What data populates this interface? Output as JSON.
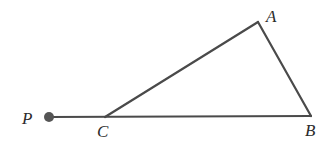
{
  "diagram": {
    "stroke_color": "#4a4a4a",
    "points": {
      "P": {
        "label": "P",
        "x": 49,
        "y": 117,
        "label_x": 22,
        "label_y": 124
      },
      "C": {
        "label": "C",
        "x": 105,
        "y": 117,
        "label_x": 97,
        "label_y": 137
      },
      "B": {
        "label": "B",
        "x": 311,
        "y": 116,
        "label_x": 305,
        "label_y": 136
      },
      "A": {
        "label": "A",
        "x": 258,
        "y": 22,
        "label_x": 266,
        "label_y": 22
      }
    },
    "segments": [
      {
        "from": "P",
        "to": "B"
      },
      {
        "from": "C",
        "to": "A"
      },
      {
        "from": "A",
        "to": "B"
      }
    ],
    "dot": {
      "at": "P",
      "radius": 5,
      "color": "#555555"
    }
  }
}
